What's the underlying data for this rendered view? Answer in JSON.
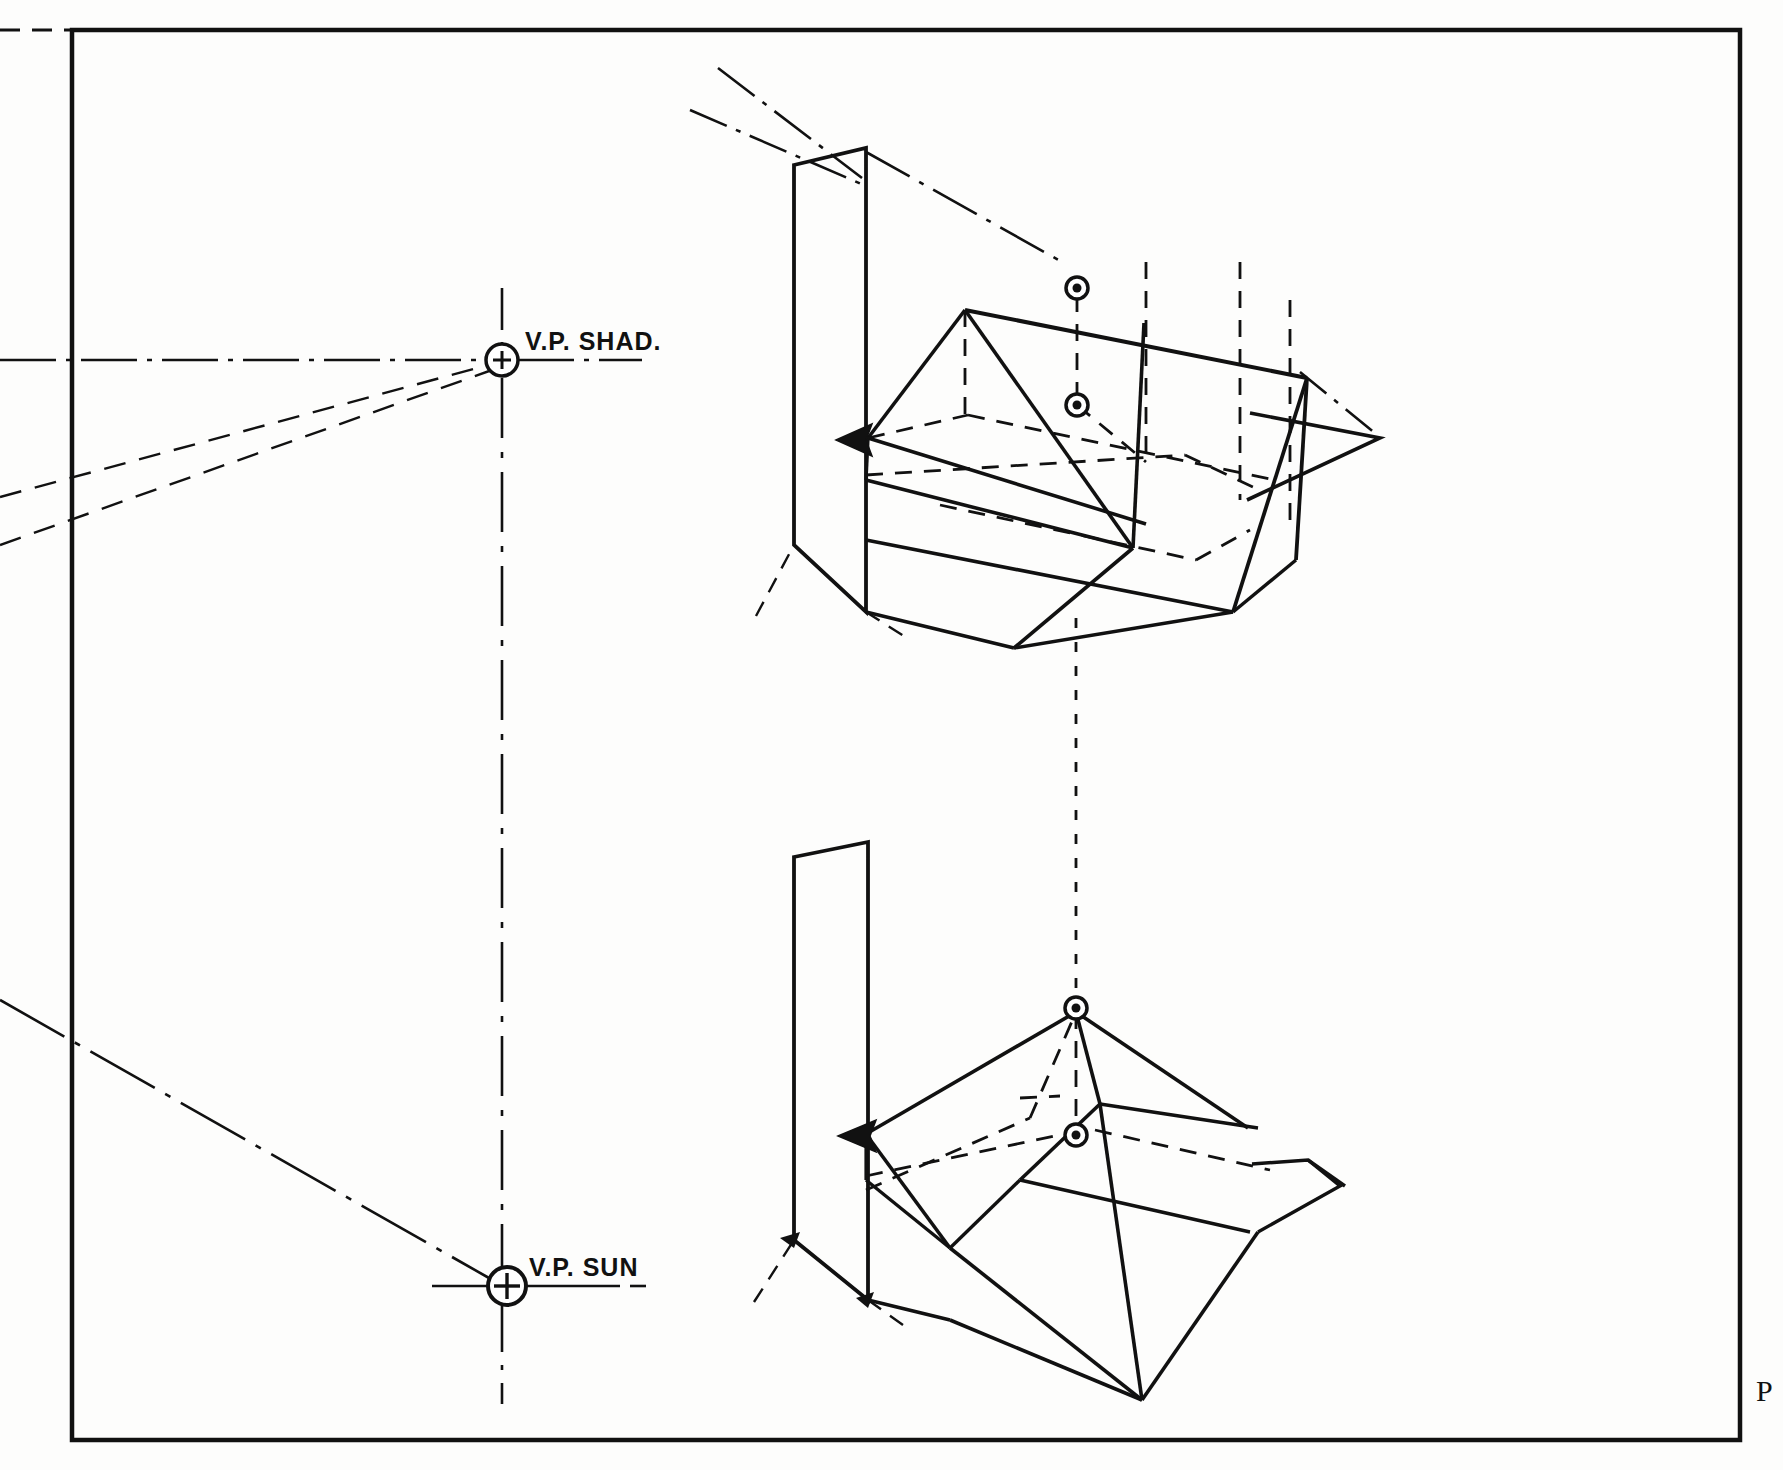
{
  "sheet": {
    "title": "Perspective Shadow Construction",
    "background_color": "#fdfdfc",
    "ink_color": "#111111",
    "border": {
      "name": "drawing-border-frame",
      "x": 72,
      "y": 30,
      "width": 1668,
      "height": 1410,
      "stroke_width": 4
    },
    "plate_mark": "P"
  },
  "labels": {
    "vp_shadow": "V.P. SHAD.",
    "vp_sun": "V.P. SUN"
  },
  "vanishing_points": [
    {
      "id": "vp-shadow",
      "label": "V.P. SHAD.",
      "x": 502,
      "y": 360,
      "radius": 16,
      "marker": "circled-plus"
    },
    {
      "id": "vp-sun",
      "label": "V.P. SUN",
      "x": 507,
      "y": 1286,
      "radius": 18,
      "marker": "circled-plus"
    }
  ],
  "construction_lines": {
    "horizon_dashdot": {
      "name": "horizon-line",
      "from_x": 0,
      "from_y": 360,
      "to_x": 640,
      "to_y": 360,
      "style": "dash-dot"
    },
    "vp_axis_vertical": {
      "name": "vertical-axis-through-vanishing-points",
      "x": 502,
      "from_y": 290,
      "to_y": 1400,
      "style": "dash-dot"
    },
    "shadow_rays": [
      {
        "name": "shadow-ray-upper",
        "from_x": 0,
        "from_y": 492,
        "to_x": 496,
        "to_y": 364,
        "style": "dashed"
      },
      {
        "name": "shadow-ray-lower",
        "from_x": 0,
        "from_y": 540,
        "to_x": 496,
        "to_y": 366,
        "style": "dashed"
      }
    ],
    "sun_ray": {
      "name": "sun-ray-to-vp-sun",
      "from_x": 0,
      "from_y": 1000,
      "to_x": 500,
      "to_y": 1282,
      "style": "dash-dot"
    },
    "inter_view_connector": {
      "name": "vertical-projection-connector",
      "x": 1076,
      "from_y": 615,
      "to_y": 1010,
      "style": "dashed"
    }
  },
  "views": [
    {
      "id": "upper-view",
      "name": "upper-perspective-view",
      "description": "Gable/wedge solid with vertical picture plane wall, cast shadow and construction dashes",
      "marked_points": [
        {
          "name": "ridge-point-marker",
          "x": 1077,
          "y": 288,
          "marker": "circled-dot"
        },
        {
          "name": "ground-projection-marker",
          "x": 1077,
          "y": 405,
          "marker": "circled-dot"
        }
      ],
      "arrow": {
        "name": "direction-arrowhead",
        "x": 849,
        "y": 440,
        "points_to": "left"
      }
    },
    {
      "id": "lower-view",
      "name": "lower-perspective-view",
      "description": "Hip/pyramid solid with vertical picture plane wall, apex marker and cast shadow",
      "marked_points": [
        {
          "name": "apex-point-marker",
          "x": 1076,
          "y": 1008,
          "marker": "circled-dot"
        },
        {
          "name": "ground-projection-marker",
          "x": 1076,
          "y": 1135,
          "marker": "circled-dot"
        }
      ],
      "arrow": {
        "name": "direction-arrowhead",
        "x": 858,
        "y": 1136,
        "points_to": "left"
      }
    }
  ]
}
